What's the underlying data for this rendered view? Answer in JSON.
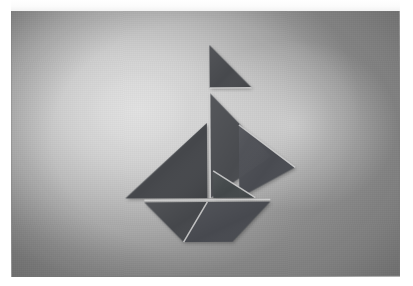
{
  "scene": {
    "title": "Tangram sailboat",
    "medium": "photograph",
    "description": "A seven-piece tangram arranged as a sailboat, photographed against a softly lit gray studio backdrop with a bright hotspot behind the figure and darker vignetted corners.",
    "subject": "sailboat"
  },
  "photo": {
    "x": 11,
    "y": 9,
    "width": 389,
    "height": 268,
    "rotation_deg": -0.35,
    "border_label": "photo-edge",
    "margin_color": "#ffffff"
  },
  "palette": {
    "piece_fill": "#45484c",
    "piece_fill_light": "#50545a",
    "piece_fill_dark": "#3b3e42",
    "seam_color": "#d5d5d5",
    "background_center": "#e2e2e2",
    "background_mid": "#bdbdbd",
    "background_corner": "#8a8a8a",
    "paper_white": "#ffffff"
  },
  "tangram": {
    "piece_count": 7,
    "pieces": [
      {
        "id": "flag",
        "name": "flag-pennant-triangle",
        "shape": "small-triangle",
        "points": "203,40 203,83 245,83",
        "fill": "#474a4e",
        "role": "pennant at masthead"
      },
      {
        "id": "upper-sail",
        "name": "upper-sail-large-triangle",
        "shape": "large-triangle",
        "points": "203,88 203,193 264,152",
        "fill": "#484b50",
        "role": "upper right sail"
      },
      {
        "id": "mainsail-left",
        "name": "mainsail-left-large-triangle",
        "shape": "large-triangle",
        "points": "200,118 200,193 118,193",
        "fill": "#44474b",
        "role": "large left mainsail"
      },
      {
        "id": "sail-right-medium",
        "name": "right-sail-medium-triangle",
        "shape": "medium-triangle",
        "points": "232,120 288,163 232,193",
        "fill": "#494c51",
        "role": "right jib upper"
      },
      {
        "id": "sail-right-small",
        "name": "right-sail-small-triangle",
        "shape": "small-triangle",
        "points": "206,166 248,193 206,193",
        "fill": "#43464a",
        "role": "right jib lower"
      },
      {
        "id": "hull-left",
        "name": "hull-left-triangle",
        "shape": "triangle",
        "points": "137,197 200,197 176,237",
        "fill": "#44474c",
        "role": "left half of hull"
      },
      {
        "id": "hull-right",
        "name": "hull-right-trapezoid",
        "shape": "trapezoid",
        "points": "200,197 263,197 225,237 176,237",
        "fill": "#474a4f",
        "role": "right half of hull"
      }
    ],
    "seams": [
      {
        "name": "mast-vertical-seam",
        "from": "203,88",
        "to": "203,193"
      },
      {
        "name": "deck-horizontal-seam",
        "from": "137,195",
        "to": "263,195"
      },
      {
        "name": "sail-diagonal-seam",
        "from": "232,120",
        "to": "288,163"
      },
      {
        "name": "jib-diagonal-seam",
        "from": "206,166",
        "to": "248,193"
      },
      {
        "name": "hull-diagonal-seam",
        "from": "200,197",
        "to": "176,237"
      },
      {
        "name": "flag-base-seam",
        "from": "203,83",
        "to": "245,83"
      }
    ],
    "bounds": {
      "left": 118,
      "top": 40,
      "right": 288,
      "bottom": 237
    }
  }
}
